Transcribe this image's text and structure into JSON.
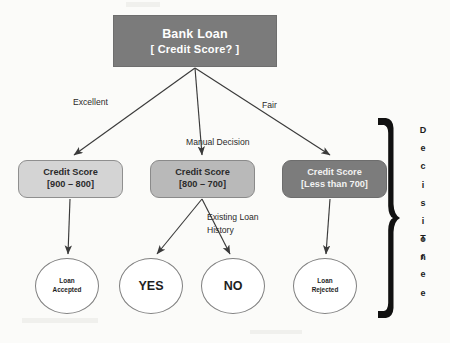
{
  "diagram": {
    "caption_vertical": [
      "Decision",
      "Tree"
    ],
    "root": {
      "line1": "Bank Loan",
      "line2": "[ Credit Score? ]"
    },
    "edge_labels": {
      "left": "Excellent",
      "middle": "Manual Decision",
      "right": "Fair",
      "middle_branch_line1": "Existing Loan",
      "middle_branch_line2": "History"
    },
    "level2": [
      {
        "line1": "Credit Score",
        "line2": "[900 – 800]"
      },
      {
        "line1": "Credit Score",
        "line2": "[800 – 700]"
      },
      {
        "line1": "Credit Score",
        "line2": "[Less than 700]"
      }
    ],
    "leaves": [
      {
        "line1": "Loan",
        "line2": "Accepted"
      },
      {
        "line1": "YES",
        "line2": ""
      },
      {
        "line1": "NO",
        "line2": ""
      },
      {
        "line1": "Loan",
        "line2": "Rejected"
      }
    ],
    "colors": {
      "root_fill": "#7b7b7b",
      "node_a_fill": "#d4d4d4",
      "node_b_fill": "#b9b9b9",
      "node_c_fill": "#7c7c7c",
      "leaf_fill": "#ffffff",
      "brace": "#111111",
      "edge": "#3a3a3a",
      "background": "#fbfbf9"
    }
  }
}
